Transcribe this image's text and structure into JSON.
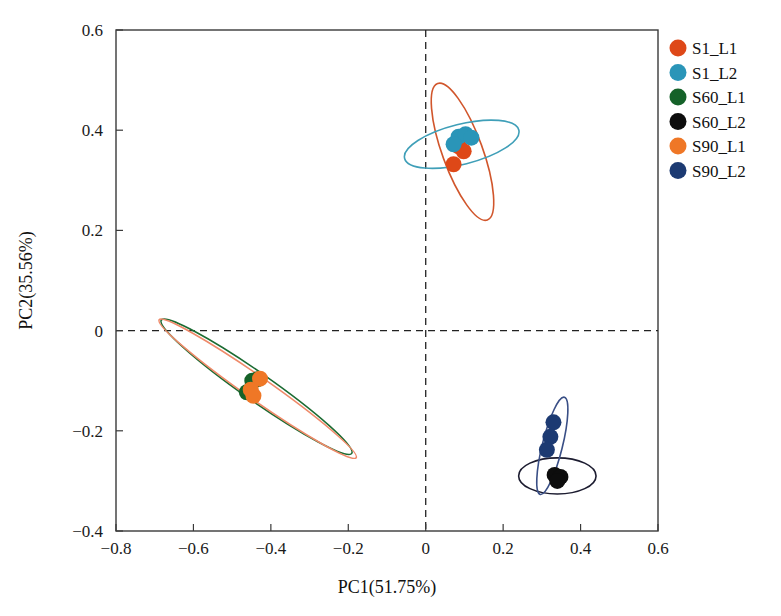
{
  "figure": {
    "title": "",
    "caption": ""
  },
  "chart_data": {
    "type": "scatter",
    "title": "",
    "xlabel": "PC1(51.75%)",
    "ylabel": "PC2(35.56%)",
    "xlim": [
      -0.8,
      0.6
    ],
    "ylim": [
      -0.4,
      0.6
    ],
    "xticks": [
      -0.8,
      -0.6,
      -0.4,
      -0.2,
      0,
      0.2,
      0.4,
      0.6
    ],
    "xtick_labels": [
      "−0.8",
      "−0.6",
      "−0.4",
      "−0.2",
      "0",
      "0.2",
      "0.4",
      "0.6"
    ],
    "yticks": [
      -0.4,
      -0.2,
      0,
      0.2,
      0.4,
      0.6
    ],
    "ytick_labels": [
      "−0.4",
      "−0.2",
      "0",
      "0.2",
      "0.4",
      "0.6"
    ],
    "grid": false,
    "reference_lines": [
      {
        "orientation": "vertical",
        "value": 0,
        "style": "dashed",
        "color": "#222222"
      },
      {
        "orientation": "horizontal",
        "value": 0,
        "style": "dashed",
        "color": "#222222"
      }
    ],
    "legend_position": "right",
    "marker_radius_px": 8,
    "series": [
      {
        "name": "S1_L1",
        "color": "#de4818",
        "points": [
          {
            "x": 0.085,
            "y": 0.368
          },
          {
            "x": 0.098,
            "y": 0.358
          },
          {
            "x": 0.072,
            "y": 0.332
          }
        ],
        "ellipse": {
          "cx": 0.095,
          "cy": 0.357,
          "rx": 0.052,
          "ry": 0.145,
          "rotation_deg": -20,
          "color": "#d1562c"
        }
      },
      {
        "name": "S1_L2",
        "color": "#2a95b8",
        "points": [
          {
            "x": 0.085,
            "y": 0.387
          },
          {
            "x": 0.103,
            "y": 0.392
          },
          {
            "x": 0.118,
            "y": 0.385
          },
          {
            "x": 0.072,
            "y": 0.372
          }
        ],
        "ellipse": {
          "cx": 0.093,
          "cy": 0.372,
          "rx": 0.152,
          "ry": 0.04,
          "rotation_deg": -14,
          "color": "#3f9fb8"
        }
      },
      {
        "name": "S60_L1",
        "color": "#156229",
        "points": [
          {
            "x": -0.448,
            "y": -0.1
          },
          {
            "x": -0.434,
            "y": -0.097
          },
          {
            "x": -0.462,
            "y": -0.123
          }
        ],
        "ellipse": {
          "cx": -0.437,
          "cy": -0.112,
          "rx": 0.036,
          "ry": 0.232,
          "rotation_deg": -55,
          "color": "#1b6b32"
        }
      },
      {
        "name": "S60_L2",
        "color": "#0d0d0d",
        "points": [
          {
            "x": 0.333,
            "y": -0.288
          },
          {
            "x": 0.348,
            "y": -0.292
          },
          {
            "x": 0.34,
            "y": -0.3
          }
        ],
        "ellipse": {
          "cx": 0.34,
          "cy": -0.29,
          "rx": 0.1,
          "ry": 0.036,
          "rotation_deg": 0,
          "color": "#1c1c30"
        }
      },
      {
        "name": "S90_L1",
        "color": "#ef7726",
        "points": [
          {
            "x": -0.428,
            "y": -0.096
          },
          {
            "x": -0.452,
            "y": -0.118
          },
          {
            "x": -0.445,
            "y": -0.13
          }
        ],
        "ellipse": {
          "cx": -0.434,
          "cy": -0.116,
          "rx": 0.03,
          "ry": 0.24,
          "rotation_deg": -55,
          "color": "#ef8a6a"
        }
      },
      {
        "name": "S90_L2",
        "color": "#1c3a72",
        "points": [
          {
            "x": 0.33,
            "y": -0.183
          },
          {
            "x": 0.322,
            "y": -0.212
          },
          {
            "x": 0.313,
            "y": -0.238
          }
        ],
        "ellipse": {
          "cx": 0.327,
          "cy": -0.23,
          "rx": 0.026,
          "ry": 0.1,
          "rotation_deg": 14,
          "color": "#3a4f86"
        }
      }
    ],
    "legend": [
      {
        "label": "S1_L1",
        "color": "#de4818"
      },
      {
        "label": "S1_L2",
        "color": "#2a95b8"
      },
      {
        "label": "S60_L1",
        "color": "#156229"
      },
      {
        "label": "S60_L2",
        "color": "#0d0d0d"
      },
      {
        "label": "S90_L1",
        "color": "#ef7726"
      },
      {
        "label": "S90_L2",
        "color": "#1c3a72"
      }
    ]
  }
}
